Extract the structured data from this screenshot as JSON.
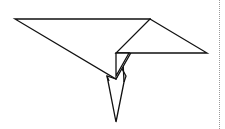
{
  "figure": {
    "stroke_color": "#111111",
    "fill_color": "#ffffff",
    "divider_color": "#9a9a9a",
    "shapes": {
      "left_wing": [
        [
          15,
          19
        ],
        [
          150,
          19
        ],
        [
          116,
          79
        ]
      ],
      "right_wing": [
        [
          150,
          19
        ],
        [
          207,
          53
        ],
        [
          116,
          53
        ]
      ],
      "fold_strip": [
        [
          116,
          53
        ],
        [
          128,
          53
        ],
        [
          116,
          76
        ]
      ],
      "tail": [
        [
          107,
          76
        ],
        [
          116,
          122
        ],
        [
          126,
          76
        ],
        [
          121,
          67
        ],
        [
          116,
          79
        ]
      ],
      "tail_inner": [
        [
          125,
          60
        ],
        [
          126,
          80
        ]
      ]
    }
  }
}
